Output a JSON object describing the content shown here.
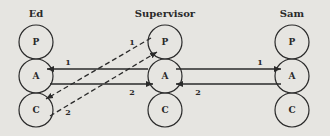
{
  "people": [
    {
      "name": "Ed",
      "states": [
        "P",
        "A",
        "C"
      ]
    },
    {
      "name": "Supervisor",
      "states": [
        "P",
        "A",
        "C"
      ]
    },
    {
      "name": "Sam",
      "states": [
        "P",
        "A",
        "C"
      ]
    }
  ],
  "transactions": [
    {
      "from": "Supervisor.A",
      "to": "Ed.A",
      "label": "1",
      "style": "solid"
    },
    {
      "from": "Ed.A",
      "to": "Supervisor.A",
      "label": "2",
      "style": "solid"
    },
    {
      "from": "Supervisor.P",
      "to": "Ed.C",
      "label": "1",
      "style": "dashed"
    },
    {
      "from": "Ed.C",
      "to": "Supervisor.P",
      "label": "2",
      "style": "dashed"
    },
    {
      "from": "Supervisor.A",
      "to": "Sam.A",
      "label": "1",
      "style": "solid"
    },
    {
      "from": "Sam.A",
      "to": "Supervisor.A",
      "label": "2",
      "style": "solid"
    }
  ],
  "colors": {
    "background": "#e6e5e1",
    "stroke": "#2a2a2a"
  }
}
